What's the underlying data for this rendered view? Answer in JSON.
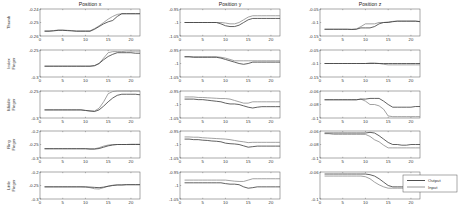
{
  "chart_data": {
    "type": "line",
    "colors": {
      "output": "#3a3a3a",
      "input": "#8a8a8a",
      "axis": "#555555"
    },
    "legend": {
      "entries": [
        "Output",
        "Input"
      ],
      "placement": "bottom-right"
    },
    "columns": [
      "Position x",
      "Position y",
      "Position z"
    ],
    "rows": [
      [
        "Thumb"
      ],
      [
        "Index",
        "Finger"
      ],
      [
        "Middle",
        "Finger"
      ],
      [
        "Ring",
        "Finger"
      ],
      [
        "Little",
        "Finger"
      ]
    ],
    "x": [
      1,
      2,
      3,
      4,
      5,
      6,
      7,
      8,
      9,
      10,
      11,
      12,
      13,
      14,
      15,
      16,
      17,
      18,
      19,
      20,
      21,
      22
    ],
    "xlim": [
      0,
      22
    ],
    "xticks": [
      0,
      5,
      10,
      15,
      20
    ],
    "panels": [
      [
        {
          "ylim": [
            -0.26,
            -0.24
          ],
          "yticks": [
            "-0.24",
            "-0.25",
            "-0.26"
          ],
          "output": [
            -0.2565,
            -0.2565,
            -0.2562,
            -0.2558,
            -0.2558,
            -0.256,
            -0.2562,
            -0.2565,
            -0.2565,
            -0.2565,
            -0.2565,
            -0.255,
            -0.253,
            -0.251,
            -0.2495,
            -0.2485,
            -0.2455,
            -0.2435,
            -0.2435,
            -0.2435,
            -0.2435,
            -0.2435
          ],
          "input": [
            -0.2562,
            -0.2562,
            -0.256,
            -0.2556,
            -0.2556,
            -0.2558,
            -0.256,
            -0.2562,
            -0.2562,
            -0.2562,
            -0.2562,
            -0.2545,
            -0.2525,
            -0.25,
            -0.2475,
            -0.2455,
            -0.244,
            -0.2435,
            -0.2435,
            -0.2435,
            -0.2435,
            -0.2435
          ]
        },
        {
          "ylim": [
            -1.05,
            -0.95
          ],
          "yticks": [
            "-0.95",
            "-1",
            "-1.05"
          ],
          "output": [
            -1.0,
            -1.0,
            -1.0,
            -1.0,
            -1.0,
            -1.0,
            -1.0,
            -1.0,
            -1.005,
            -1.012,
            -1.015,
            -1.015,
            -1.01,
            -1.0,
            -0.99,
            -0.985,
            -0.985,
            -0.985,
            -0.985,
            -0.985,
            -0.985,
            -0.985
          ],
          "input": [
            -1.0,
            -1.0,
            -1.0,
            -1.0,
            -1.0,
            -1.0,
            -1.0,
            -1.0,
            -1.0,
            -1.002,
            -1.005,
            -1.005,
            -1.0,
            -0.99,
            -0.98,
            -0.975,
            -0.975,
            -0.975,
            -0.975,
            -0.975,
            -0.975,
            -0.975
          ]
        },
        {
          "ylim": [
            -0.15,
            -0.05
          ],
          "yticks": [
            "-0.05",
            "-0.1",
            "-0.15"
          ],
          "output": [
            -0.125,
            -0.125,
            -0.125,
            -0.125,
            -0.125,
            -0.125,
            -0.126,
            -0.125,
            -0.12,
            -0.12,
            -0.12,
            -0.115,
            -0.105,
            -0.1,
            -0.1,
            -0.097,
            -0.095,
            -0.095,
            -0.095,
            -0.095,
            -0.095,
            -0.097
          ],
          "input": [
            -0.125,
            -0.125,
            -0.125,
            -0.125,
            -0.125,
            -0.125,
            -0.125,
            -0.124,
            -0.115,
            -0.105,
            -0.105,
            -0.105,
            -0.1,
            -0.1,
            -0.098,
            -0.096,
            -0.095,
            -0.095,
            -0.095,
            -0.095,
            -0.095,
            -0.096
          ]
        }
      ],
      [
        {
          "ylim": [
            -0.3,
            -0.25
          ],
          "yticks": [
            "-0.25",
            "-0.3"
          ],
          "output": [
            -0.28,
            -0.28,
            -0.28,
            -0.28,
            -0.28,
            -0.28,
            -0.28,
            -0.28,
            -0.28,
            -0.28,
            -0.28,
            -0.279,
            -0.275,
            -0.268,
            -0.262,
            -0.258,
            -0.255,
            -0.255,
            -0.255,
            -0.255,
            -0.256,
            -0.256
          ],
          "input": [
            -0.28,
            -0.28,
            -0.28,
            -0.28,
            -0.28,
            -0.28,
            -0.28,
            -0.28,
            -0.28,
            -0.28,
            -0.28,
            -0.279,
            -0.275,
            -0.265,
            -0.255,
            -0.253,
            -0.253,
            -0.253,
            -0.252,
            -0.252,
            -0.252,
            -0.252
          ]
        },
        {
          "ylim": [
            -1.05,
            -0.95
          ],
          "yticks": [
            "-0.95",
            "-1",
            "-1.05"
          ],
          "output": [
            -0.975,
            -0.975,
            -0.977,
            -0.977,
            -0.977,
            -0.977,
            -0.977,
            -0.977,
            -0.98,
            -0.985,
            -0.99,
            -0.995,
            -1.0,
            -1.003,
            -1.0,
            -0.995,
            -0.995,
            -0.995,
            -0.995,
            -0.995,
            -0.995,
            -0.995
          ],
          "input": [
            -0.975,
            -0.975,
            -0.975,
            -0.975,
            -0.975,
            -0.975,
            -0.975,
            -0.975,
            -0.977,
            -0.98,
            -0.985,
            -0.99,
            -0.99,
            -0.99,
            -0.99,
            -0.99,
            -0.99,
            -0.99,
            -0.99,
            -0.99,
            -0.99,
            -0.99
          ]
        },
        {
          "ylim": [
            -0.15,
            -0.05
          ],
          "yticks": [
            "-0.05",
            "-0.1",
            "-0.15"
          ],
          "output": [
            -0.1,
            -0.1,
            -0.1,
            -0.1,
            -0.1,
            -0.1,
            -0.1,
            -0.1,
            -0.1,
            -0.1,
            -0.1,
            -0.1,
            -0.1,
            -0.1,
            -0.1,
            -0.1,
            -0.1,
            -0.1,
            -0.1,
            -0.1,
            -0.1,
            -0.1
          ],
          "input": [
            -0.1,
            -0.1,
            -0.1,
            -0.1,
            -0.1,
            -0.1,
            -0.1,
            -0.1,
            -0.1,
            -0.1,
            -0.098,
            -0.098,
            -0.1,
            -0.103,
            -0.105,
            -0.105,
            -0.105,
            -0.105,
            -0.105,
            -0.105,
            -0.105,
            -0.105
          ]
        }
      ],
      [
        {
          "ylim": [
            -0.3,
            -0.25
          ],
          "yticks": [
            "-0.25",
            "-0.3"
          ],
          "output": [
            -0.285,
            -0.285,
            -0.285,
            -0.285,
            -0.285,
            -0.285,
            -0.285,
            -0.285,
            -0.285,
            -0.286,
            -0.287,
            -0.288,
            -0.285,
            -0.278,
            -0.27,
            -0.263,
            -0.258,
            -0.256,
            -0.256,
            -0.256,
            -0.256,
            -0.257
          ],
          "input": [
            -0.285,
            -0.285,
            -0.285,
            -0.285,
            -0.285,
            -0.285,
            -0.285,
            -0.285,
            -0.285,
            -0.286,
            -0.287,
            -0.287,
            -0.282,
            -0.27,
            -0.255,
            -0.251,
            -0.25,
            -0.25,
            -0.25,
            -0.25,
            -0.25,
            -0.25
          ]
        },
        {
          "ylim": [
            -1.05,
            -0.95
          ],
          "yticks": [
            "-0.95",
            "-1",
            "-1.05"
          ],
          "output": [
            -0.98,
            -0.98,
            -0.98,
            -0.982,
            -0.982,
            -0.984,
            -0.986,
            -0.988,
            -0.99,
            -0.995,
            -0.998,
            -0.998,
            -1.0,
            -1.005,
            -1.01,
            -1.013,
            -1.01,
            -1.008,
            -1.008,
            -1.008,
            -1.008,
            -1.008
          ],
          "input": [
            -0.972,
            -0.972,
            -0.972,
            -0.974,
            -0.974,
            -0.975,
            -0.976,
            -0.977,
            -0.978,
            -0.978,
            -0.98,
            -0.985,
            -0.99,
            -0.995,
            -0.995,
            -0.99,
            -0.99,
            -0.99,
            -0.99,
            -0.99,
            -0.99,
            -0.99
          ]
        },
        {
          "ylim": [
            -0.1,
            -0.06
          ],
          "yticks": [
            "-0.06",
            "-0.08",
            "-0.1"
          ],
          "output": [
            -0.073,
            -0.073,
            -0.073,
            -0.073,
            -0.073,
            -0.073,
            -0.073,
            -0.073,
            -0.072,
            -0.072,
            -0.071,
            -0.071,
            -0.071,
            -0.075,
            -0.08,
            -0.084,
            -0.084,
            -0.084,
            -0.084,
            -0.084,
            -0.083,
            -0.083
          ],
          "input": [
            -0.073,
            -0.073,
            -0.073,
            -0.073,
            -0.073,
            -0.073,
            -0.073,
            -0.073,
            -0.072,
            -0.075,
            -0.08,
            -0.08,
            -0.082,
            -0.087,
            -0.097,
            -0.098,
            -0.098,
            -0.098,
            -0.098,
            -0.098,
            -0.098,
            -0.098
          ]
        }
      ],
      [
        {
          "ylim": [
            -0.3,
            -0.2
          ],
          "yticks": [
            "-0.2",
            "-0.25",
            "-0.3"
          ],
          "output": [
            -0.266,
            -0.266,
            -0.266,
            -0.266,
            -0.266,
            -0.266,
            -0.266,
            -0.266,
            -0.266,
            -0.266,
            -0.267,
            -0.267,
            -0.265,
            -0.26,
            -0.255,
            -0.252,
            -0.25,
            -0.25,
            -0.25,
            -0.25,
            -0.25,
            -0.25
          ],
          "input": [
            -0.265,
            -0.265,
            -0.265,
            -0.265,
            -0.265,
            -0.265,
            -0.265,
            -0.265,
            -0.265,
            -0.265,
            -0.266,
            -0.266,
            -0.262,
            -0.256,
            -0.252,
            -0.25,
            -0.25,
            -0.25,
            -0.25,
            -0.249,
            -0.249,
            -0.249
          ]
        },
        {
          "ylim": [
            -1.05,
            -0.95
          ],
          "yticks": [
            "-0.95",
            "-1",
            "-1.05"
          ],
          "output": [
            -0.98,
            -0.98,
            -0.982,
            -0.982,
            -0.984,
            -0.985,
            -0.987,
            -0.988,
            -0.99,
            -0.995,
            -0.997,
            -0.998,
            -1.0,
            -1.005,
            -1.01,
            -1.008,
            -1.006,
            -1.006,
            -1.006,
            -1.006,
            -1.006,
            -1.006
          ],
          "input": [
            -0.972,
            -0.972,
            -0.973,
            -0.973,
            -0.975,
            -0.976,
            -0.977,
            -0.978,
            -0.979,
            -0.98,
            -0.982,
            -0.985,
            -0.988,
            -0.99,
            -0.993,
            -0.992,
            -0.992,
            -0.992,
            -0.992,
            -0.992,
            -0.992,
            -0.992
          ]
        },
        {
          "ylim": [
            -0.1,
            -0.06
          ],
          "yticks": [
            "-0.06",
            "-0.08",
            "-0.1"
          ],
          "output": [
            -0.063,
            -0.063,
            -0.063,
            -0.063,
            -0.063,
            -0.063,
            -0.063,
            -0.063,
            -0.063,
            -0.063,
            -0.062,
            -0.063,
            -0.067,
            -0.072,
            -0.077,
            -0.08,
            -0.08,
            -0.081,
            -0.081,
            -0.08,
            -0.08,
            -0.08
          ],
          "input": [
            -0.064,
            -0.064,
            -0.065,
            -0.065,
            -0.065,
            -0.065,
            -0.065,
            -0.065,
            -0.065,
            -0.065,
            -0.068,
            -0.073,
            -0.076,
            -0.081,
            -0.085,
            -0.085,
            -0.085,
            -0.085,
            -0.085,
            -0.085,
            -0.085,
            -0.085
          ]
        }
      ],
      [
        {
          "ylim": [
            -0.3,
            -0.2
          ],
          "yticks": [
            "-0.2",
            "-0.25",
            "-0.3"
          ],
          "output": [
            -0.255,
            -0.255,
            -0.255,
            -0.255,
            -0.255,
            -0.255,
            -0.255,
            -0.255,
            -0.255,
            -0.255,
            -0.256,
            -0.257,
            -0.258,
            -0.256,
            -0.253,
            -0.25,
            -0.248,
            -0.248,
            -0.247,
            -0.247,
            -0.247,
            -0.247
          ],
          "input": [
            -0.255,
            -0.255,
            -0.255,
            -0.255,
            -0.255,
            -0.255,
            -0.255,
            -0.255,
            -0.255,
            -0.256,
            -0.258,
            -0.262,
            -0.263,
            -0.258,
            -0.252,
            -0.249,
            -0.248,
            -0.248,
            -0.247,
            -0.247,
            -0.247,
            -0.247
          ]
        },
        {
          "ylim": [
            -1.05,
            -0.95
          ],
          "yticks": [
            "-0.95",
            "-1",
            "-1.05"
          ],
          "output": [
            -0.99,
            -0.99,
            -0.99,
            -0.99,
            -0.99,
            -0.99,
            -0.99,
            -0.99,
            -0.99,
            -0.993,
            -0.995,
            -0.995,
            -0.997,
            -1.005,
            -1.01,
            -1.008,
            -1.005,
            -1.005,
            -1.005,
            -1.005,
            -1.005,
            -1.005
          ],
          "input": [
            -0.98,
            -0.98,
            -0.98,
            -0.98,
            -0.98,
            -0.98,
            -0.98,
            -0.98,
            -0.98,
            -0.98,
            -0.982,
            -0.984,
            -0.985,
            -0.985,
            -0.98,
            -0.975,
            -0.975,
            -0.975,
            -0.975,
            -0.975,
            -0.975,
            -0.975
          ]
        },
        {
          "ylim": [
            -0.1,
            -0.06
          ],
          "yticks": [
            "-0.06",
            "-0.1"
          ],
          "output": [
            -0.063,
            -0.063,
            -0.063,
            -0.063,
            -0.063,
            -0.063,
            -0.063,
            -0.063,
            -0.063,
            -0.063,
            -0.064,
            -0.066,
            -0.07,
            -0.075,
            -0.08,
            -0.082,
            -0.082,
            -0.082,
            -0.082,
            -0.082,
            -0.082,
            -0.082
          ],
          "input": [
            -0.066,
            -0.066,
            -0.066,
            -0.066,
            -0.066,
            -0.066,
            -0.066,
            -0.066,
            -0.066,
            -0.067,
            -0.07,
            -0.075,
            -0.079,
            -0.082,
            -0.084,
            -0.084,
            -0.084,
            -0.084,
            -0.084,
            -0.084,
            -0.084,
            -0.084
          ]
        }
      ]
    ]
  }
}
